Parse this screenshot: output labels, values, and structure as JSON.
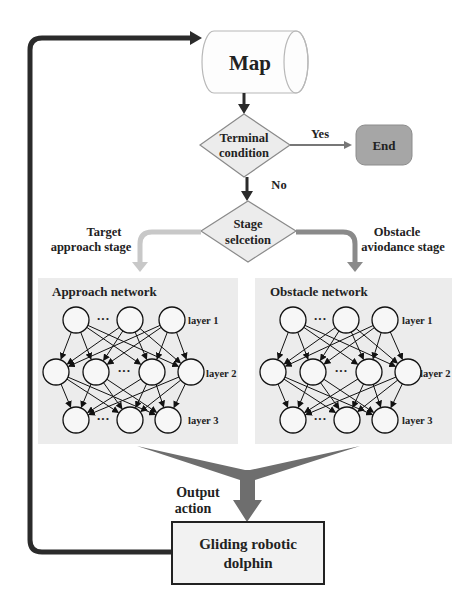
{
  "diagram": {
    "type": "flowchart",
    "nodes": {
      "map": {
        "label": "Map",
        "shape": "cylinder"
      },
      "terminal": {
        "label_lines": [
          "Terminal",
          "condition"
        ],
        "shape": "diamond"
      },
      "end": {
        "label": "End",
        "shape": "rounded-rect"
      },
      "stage": {
        "label_lines": [
          "Stage",
          "selcetion"
        ],
        "shape": "diamond"
      },
      "dolphin": {
        "label_lines": [
          "Gliding robotic",
          "dolphin"
        ],
        "shape": "rect"
      }
    },
    "edge_labels": {
      "yes": "Yes",
      "no": "No",
      "target_stage": [
        "Target",
        "approach stage"
      ],
      "obstacle_stage": [
        "Obstacle",
        "aviodance stage"
      ],
      "output_action": [
        "Output",
        "action"
      ]
    },
    "networks": [
      {
        "id": "approach",
        "title": "Approach network",
        "layers": [
          {
            "label": "layer 1",
            "nodes": 3,
            "ellipsis": "···"
          },
          {
            "label": "layer 2",
            "nodes": 4,
            "ellipsis": "···"
          },
          {
            "label": "layer 3",
            "nodes": 3,
            "ellipsis": "···"
          }
        ]
      },
      {
        "id": "obstacle",
        "title": "Obstacle network",
        "layers": [
          {
            "label": "layer 1",
            "nodes": 3,
            "ellipsis": "···"
          },
          {
            "label": "layer 2",
            "nodes": 4,
            "ellipsis": "···"
          },
          {
            "label": "layer 3",
            "nodes": 3,
            "ellipsis": "···"
          }
        ]
      }
    ],
    "colors": {
      "line_dark": "#2b2b2b",
      "diamond_fill": "#ececec",
      "end_fill": "#a6a6a6",
      "network_bg": "#ececec",
      "target_arrow": "#c8c8c8",
      "obstacle_arrow": "#8a8a8a",
      "funnel": "#6e6e6e",
      "dolphin_fill": "#f2f2f2"
    }
  }
}
